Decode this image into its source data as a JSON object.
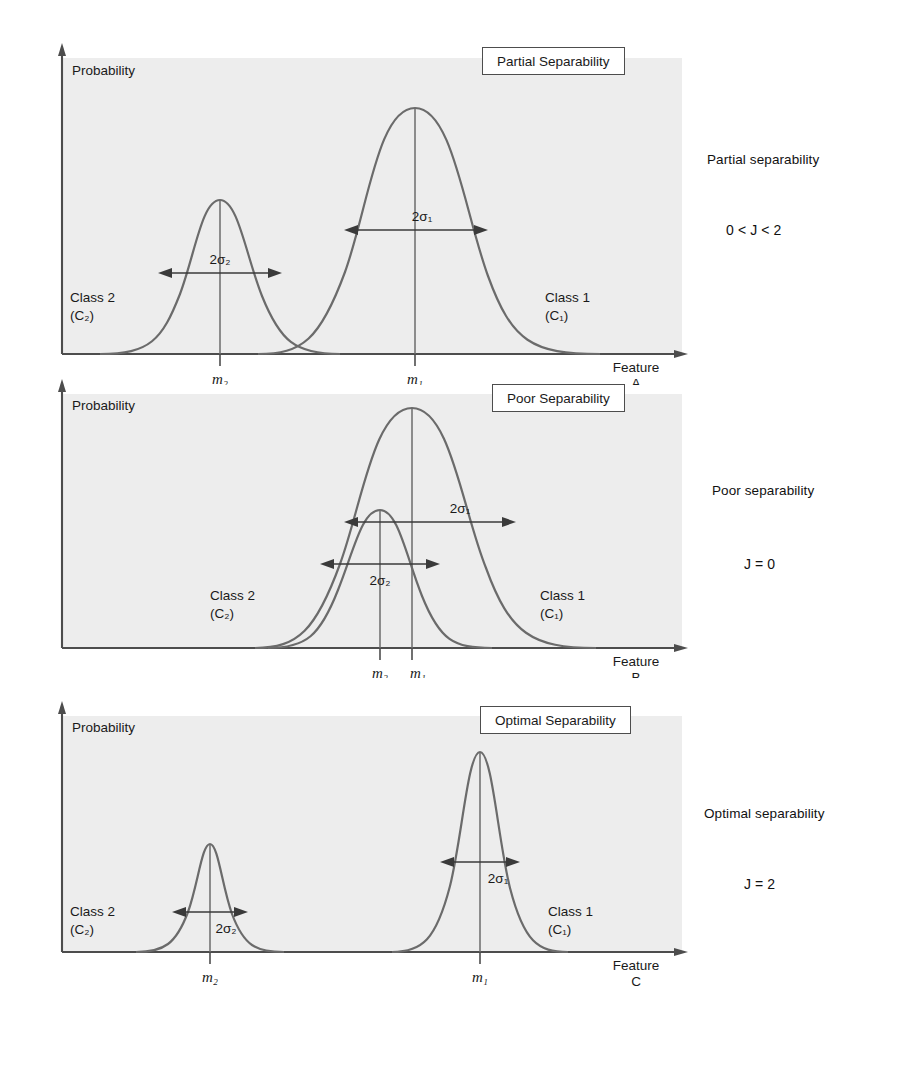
{
  "figure": {
    "axis_label_y": "Probability",
    "class1_label_line1": "Class 1",
    "class1_label_line2": "(C₁)",
    "class2_label_line1": "Class 2",
    "class2_label_line2": "(C₂)",
    "sigma1_label": "2σ₁",
    "sigma2_label": "2σ₂",
    "mean1_label": "m₁",
    "mean2_label": "m₂",
    "feature_word": "Feature",
    "ink_color": "#4d4d4d",
    "text_color": "#1a1a1a",
    "plot_fill": "#ededed"
  },
  "panels": [
    {
      "id": "panel-a",
      "box_title": "Partial Separability",
      "feature_letter": "A",
      "side_note": "Partial separability",
      "side_value": "0 < J < 2"
    },
    {
      "id": "panel-b",
      "box_title": "Poor Separability",
      "feature_letter": "B",
      "side_note": "Poor separability",
      "side_value": "J = 0"
    },
    {
      "id": "panel-c",
      "box_title": "Optimal Separability",
      "feature_letter": "C",
      "side_note": "Optimal separability",
      "side_value": "J = 2"
    }
  ],
  "chart_data": {
    "type": "line",
    "xlabel": "Feature",
    "ylabel": "Probability",
    "grid": false,
    "legend": [
      "Class 1 (C₁)",
      "Class 2 (C₂)"
    ],
    "panels": [
      {
        "name": "Partial Separability",
        "feature": "A",
        "criterion": "0 < J < 2",
        "series": [
          {
            "name": "Class 2 (C₂)",
            "mean": 0.3,
            "sigma": 0.105,
            "peak_height": 0.62
          },
          {
            "name": "Class 1 (C₁)",
            "mean": 0.63,
            "sigma": 0.125,
            "peak_height": 1.0
          }
        ]
      },
      {
        "name": "Poor Separability",
        "feature": "B",
        "criterion": "J = 0",
        "series": [
          {
            "name": "Class 2 (C₂)",
            "mean": 0.6,
            "sigma": 0.095,
            "peak_height": 0.54
          },
          {
            "name": "Class 1 (C₁)",
            "mean": 0.66,
            "sigma": 0.135,
            "peak_height": 1.0
          }
        ]
      },
      {
        "name": "Optimal Separability",
        "feature": "C",
        "criterion": "J = 2",
        "series": [
          {
            "name": "Class 2 (C₂)",
            "mean": 0.26,
            "sigma": 0.055,
            "peak_height": 0.58
          },
          {
            "name": "Class 1 (C₁)",
            "mean": 0.66,
            "sigma": 0.058,
            "peak_height": 1.0
          }
        ]
      }
    ]
  },
  "background_text": {
    "lines": [
      "parts of the image, the average of these values is",
      "obtained. The statistical images and the distribution features",
      "are subsequently shown in order to provide better",
      "The scatter plots in figure of the class separability",
      "between the two classes as a criterion, may",
      "It employs the statistical technique of cross-correlation",
      "four factors measuring the number of which a given",
      "be in a defined procedure with a specified database for",
      "ing a function which is based on a square distance index",
      "that OTB. Another potential solution, however, is",
      "more detailed measure may be obtained in practice",
      "A simple RMS method which measures the discrepancy",
      "The features and profiles implies applying values of 0.0",
      "ed used to a threshold and also as the result leading to",
      "from the illustrated data, the definition may be chosen",
      "correlation between the class data over a set of vectors"
    ]
  }
}
